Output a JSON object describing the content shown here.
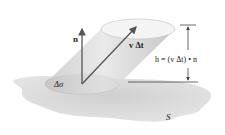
{
  "figure": {
    "labels": {
      "normal": "n",
      "velocity": "v Δt",
      "height": "h = (v Δt) • n",
      "area": "Δσ",
      "surface": "S"
    },
    "colors": {
      "surface": "#d9d9d9",
      "cylinder_side": "#cfcfcf",
      "top_cap": "#f2f2f2",
      "base_patch": "#bfbfbf",
      "arrows": "#555555",
      "lines": "#444444"
    }
  }
}
